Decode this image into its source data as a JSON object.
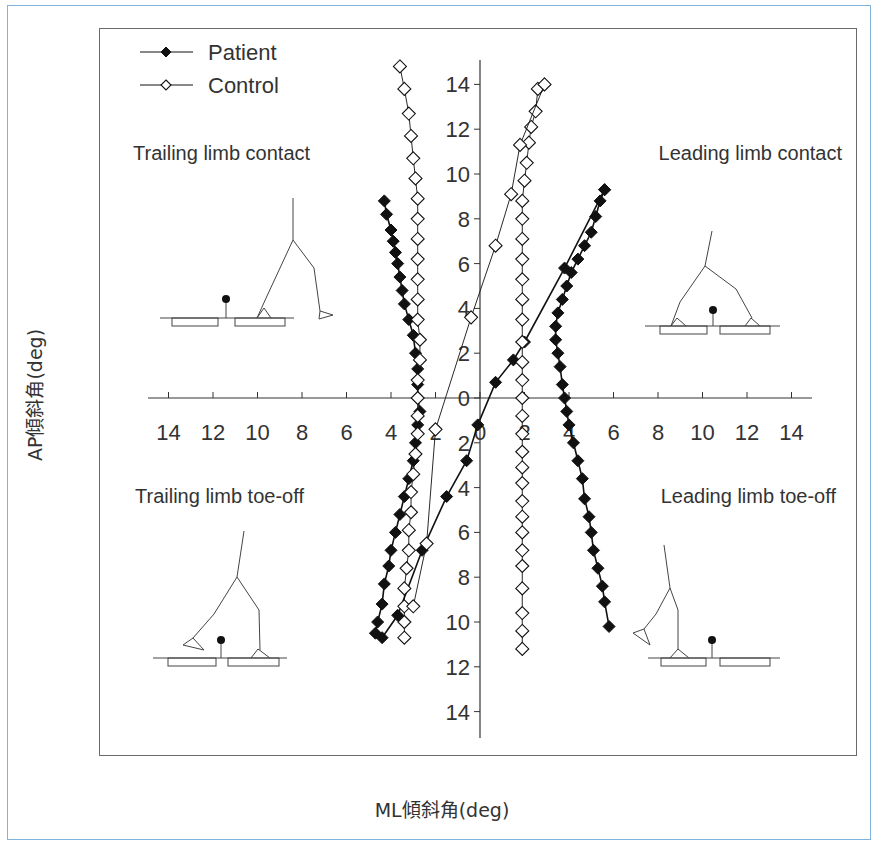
{
  "chart_data": {
    "type": "scatter",
    "title": "",
    "xlabel": "ML傾斜角(deg)",
    "ylabel": "AP傾斜角(deg)",
    "xlim": [
      -15,
      15
    ],
    "ylim": [
      -15,
      15
    ],
    "x_ticks": [
      "14",
      "12",
      "10",
      "8",
      "6",
      "4",
      "2",
      "0",
      "2",
      "4",
      "6",
      "8",
      "10",
      "12",
      "14"
    ],
    "y_ticks": [
      "14",
      "12",
      "10",
      "8",
      "6",
      "4",
      "2",
      "0",
      "2",
      "4",
      "6",
      "8",
      "10",
      "12",
      "14"
    ],
    "grid": false,
    "legend": {
      "position": "upper-left",
      "entries": [
        "Patient",
        "Control"
      ]
    },
    "annotations": [
      {
        "text": "Trailing limb contact",
        "quadrant": "upper-left"
      },
      {
        "text": "Leading limb contact",
        "quadrant": "upper-right"
      },
      {
        "text": "Trailing limb toe-off",
        "quadrant": "lower-left"
      },
      {
        "text": "Leading limb toe-off",
        "quadrant": "lower-right"
      }
    ],
    "series": [
      {
        "name": "Patient",
        "marker": "filled-diamond",
        "traces": [
          {
            "label": "left-branch",
            "points": [
              [
                -4.3,
                8.8
              ],
              [
                -4.2,
                8.2
              ],
              [
                -4.0,
                7.5
              ],
              [
                -3.9,
                7.0
              ],
              [
                -3.8,
                6.5
              ],
              [
                -3.7,
                6.0
              ],
              [
                -3.6,
                5.4
              ],
              [
                -3.5,
                4.8
              ],
              [
                -3.4,
                4.2
              ],
              [
                -3.2,
                3.5
              ],
              [
                -3.0,
                2.8
              ],
              [
                -2.9,
                2.0
              ],
              [
                -2.8,
                1.3
              ],
              [
                -2.8,
                0.6
              ],
              [
                -2.8,
                0.0
              ],
              [
                -2.7,
                -0.6
              ],
              [
                -2.8,
                -1.2
              ],
              [
                -2.9,
                -2.0
              ],
              [
                -3.0,
                -2.8
              ],
              [
                -3.2,
                -3.6
              ],
              [
                -3.4,
                -4.4
              ],
              [
                -3.6,
                -5.2
              ],
              [
                -3.8,
                -6.0
              ],
              [
                -4.0,
                -6.8
              ],
              [
                -4.1,
                -7.5
              ],
              [
                -4.3,
                -8.3
              ],
              [
                -4.4,
                -9.2
              ],
              [
                -4.6,
                -10.0
              ],
              [
                -4.7,
                -10.5
              ]
            ]
          },
          {
            "label": "right-branch",
            "points": [
              [
                5.6,
                9.3
              ],
              [
                5.4,
                8.8
              ],
              [
                5.2,
                8.1
              ],
              [
                5.0,
                7.4
              ],
              [
                4.7,
                6.8
              ],
              [
                4.4,
                6.2
              ],
              [
                4.1,
                5.6
              ],
              [
                3.9,
                5.0
              ],
              [
                3.7,
                4.4
              ],
              [
                3.5,
                3.8
              ],
              [
                3.4,
                3.2
              ],
              [
                3.4,
                2.6
              ],
              [
                3.5,
                2.0
              ],
              [
                3.6,
                1.4
              ],
              [
                3.7,
                0.6
              ],
              [
                3.8,
                0.0
              ],
              [
                3.9,
                -0.6
              ],
              [
                4.0,
                -1.2
              ],
              [
                4.2,
                -2.0
              ],
              [
                4.4,
                -2.8
              ],
              [
                4.6,
                -3.6
              ],
              [
                4.7,
                -4.5
              ],
              [
                4.9,
                -5.3
              ],
              [
                5.0,
                -6.0
              ],
              [
                5.1,
                -6.8
              ],
              [
                5.3,
                -7.6
              ],
              [
                5.5,
                -8.4
              ],
              [
                5.6,
                -9.1
              ],
              [
                5.8,
                -10.2
              ]
            ]
          },
          {
            "label": "diagonal",
            "points": [
              [
                -4.4,
                -10.7
              ],
              [
                -3.7,
                -9.7
              ],
              [
                -2.6,
                -6.8
              ],
              [
                -1.5,
                -4.4
              ],
              [
                -0.6,
                -2.8
              ],
              [
                -0.1,
                -1.2
              ],
              [
                0.7,
                0.7
              ],
              [
                1.5,
                1.7
              ],
              [
                2.0,
                2.5
              ],
              [
                3.8,
                5.8
              ],
              [
                5.6,
                9.3
              ]
            ]
          }
        ]
      },
      {
        "name": "Control",
        "marker": "open-diamond",
        "traces": [
          {
            "label": "left-branch",
            "points": [
              [
                -3.6,
                14.8
              ],
              [
                -3.4,
                13.8
              ],
              [
                -3.2,
                12.7
              ],
              [
                -3.1,
                11.7
              ],
              [
                -3.0,
                10.7
              ],
              [
                -2.9,
                9.8
              ],
              [
                -2.8,
                8.9
              ],
              [
                -2.8,
                8.0
              ],
              [
                -2.8,
                7.1
              ],
              [
                -2.8,
                6.2
              ],
              [
                -2.8,
                5.3
              ],
              [
                -2.8,
                4.4
              ],
              [
                -2.8,
                3.5
              ],
              [
                -2.7,
                2.6
              ],
              [
                -2.7,
                1.7
              ],
              [
                -2.8,
                0.8
              ],
              [
                -2.8,
                0.0
              ],
              [
                -2.8,
                -0.8
              ],
              [
                -2.8,
                -1.6
              ],
              [
                -2.9,
                -2.5
              ],
              [
                -3.0,
                -3.4
              ],
              [
                -3.1,
                -4.2
              ],
              [
                -3.1,
                -5.1
              ],
              [
                -3.2,
                -5.9
              ],
              [
                -3.2,
                -6.8
              ],
              [
                -3.3,
                -7.6
              ],
              [
                -3.4,
                -8.5
              ],
              [
                -3.4,
                -9.3
              ],
              [
                -3.4,
                -10.0
              ],
              [
                -3.4,
                -10.7
              ]
            ]
          },
          {
            "label": "right-branch",
            "points": [
              [
                2.6,
                13.8
              ],
              [
                2.5,
                12.8
              ],
              [
                2.3,
                12.1
              ],
              [
                2.2,
                11.4
              ],
              [
                2.1,
                10.5
              ],
              [
                2.0,
                9.7
              ],
              [
                1.9,
                8.8
              ],
              [
                1.9,
                8.0
              ],
              [
                1.9,
                7.1
              ],
              [
                1.9,
                6.2
              ],
              [
                1.9,
                5.3
              ],
              [
                1.9,
                4.4
              ],
              [
                1.9,
                3.5
              ],
              [
                1.9,
                2.5
              ],
              [
                1.9,
                1.6
              ],
              [
                1.9,
                0.8
              ],
              [
                1.9,
                0.0
              ],
              [
                1.9,
                -0.8
              ],
              [
                1.9,
                -1.6
              ],
              [
                1.9,
                -2.4
              ],
              [
                1.9,
                -3.1
              ],
              [
                1.9,
                -3.8
              ],
              [
                1.9,
                -4.6
              ],
              [
                1.9,
                -5.3
              ],
              [
                1.9,
                -6.0
              ],
              [
                1.9,
                -6.8
              ],
              [
                1.9,
                -7.5
              ],
              [
                1.9,
                -8.5
              ],
              [
                1.9,
                -9.6
              ],
              [
                1.9,
                -10.4
              ],
              [
                1.9,
                -11.2
              ]
            ]
          },
          {
            "label": "diagonal",
            "points": [
              [
                -3.0,
                -9.3
              ],
              [
                -2.4,
                -6.5
              ],
              [
                -2.0,
                -1.4
              ],
              [
                -0.4,
                3.6
              ],
              [
                0.7,
                6.8
              ],
              [
                1.4,
                9.1
              ],
              [
                1.8,
                11.3
              ],
              [
                2.9,
                14.0
              ]
            ]
          }
        ]
      }
    ]
  },
  "figure": {
    "xlabel": "ML傾斜角(deg)",
    "ylabel": "AP傾斜角(deg)",
    "legend": [
      {
        "label": "Patient"
      },
      {
        "label": "Control"
      }
    ],
    "annotations": {
      "trailing_contact": "Trailing limb contact",
      "leading_contact": "Leading limb contact",
      "trailing_toeoff": "Trailing limb toe-off",
      "leading_toeoff": "Leading limb toe-off"
    },
    "colors": {
      "frame_border": "#7fb3e0",
      "plot_border": "#6a6a6a",
      "ink": "#111111",
      "text": "#333333"
    }
  }
}
